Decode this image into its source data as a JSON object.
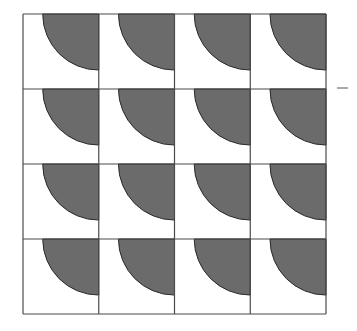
{
  "diagram": {
    "type": "tiling-pattern",
    "grid": {
      "rows": 4,
      "cols": 4,
      "left": 23,
      "top": 14,
      "right": 326,
      "bottom": 314
    },
    "tile": {
      "shape": "quarter-disc",
      "anchor": "top-right",
      "radius_ratio": 0.74
    },
    "colors": {
      "background": "#ffffff",
      "fill": "#6b6b6b",
      "stroke": "#2a2a2a",
      "grid": "#4a4a4a"
    },
    "mark": {
      "shape": "dash",
      "x1": 337,
      "y1": 88,
      "x2": 348,
      "y2": 88
    }
  }
}
